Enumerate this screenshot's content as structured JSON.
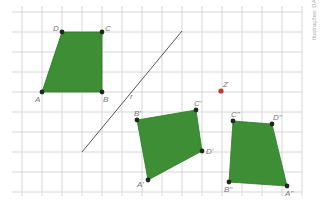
{
  "figure": {
    "credit": "Ilustrações: DAE",
    "grid": {
      "x0": 12,
      "x1": 302,
      "y0": 12,
      "y1": 192,
      "step": 20,
      "color": "#d6d6d6"
    },
    "fill_color": "#3e8e35",
    "point_color": "#1f2a1f",
    "center_color": "#c0392b",
    "line_r": {
      "label": "r",
      "x1": 182,
      "y1": 31,
      "x2": 82,
      "y2": 152
    },
    "center_z": {
      "label": "Z",
      "x": 221,
      "y": 91
    },
    "polygons": [
      {
        "name": "ABCD",
        "points": [
          {
            "label": "A",
            "x": 42,
            "y": 92,
            "lx": 35,
            "ly": 102
          },
          {
            "label": "B",
            "x": 102,
            "y": 92,
            "lx": 103,
            "ly": 102
          },
          {
            "label": "C",
            "x": 102,
            "y": 32,
            "lx": 105,
            "ly": 31
          },
          {
            "label": "D",
            "x": 62,
            "y": 32,
            "lx": 53,
            "ly": 31
          }
        ]
      },
      {
        "name": "A'B'C'D'",
        "points": [
          {
            "label": "A'",
            "x": 148,
            "y": 180,
            "lx": 137,
            "ly": 187
          },
          {
            "label": "B'",
            "x": 137,
            "y": 120,
            "lx": 134,
            "ly": 116
          },
          {
            "label": "C'",
            "x": 196,
            "y": 110,
            "lx": 194,
            "ly": 106
          },
          {
            "label": "D'",
            "x": 202,
            "y": 151,
            "lx": 206,
            "ly": 154
          }
        ]
      },
      {
        "name": "A''B''C''D''",
        "points": [
          {
            "label": "A''",
            "x": 287,
            "y": 186,
            "lx": 285,
            "ly": 196
          },
          {
            "label": "B''",
            "x": 229,
            "y": 182,
            "lx": 224,
            "ly": 192
          },
          {
            "label": "C''",
            "x": 233,
            "y": 121,
            "lx": 231,
            "ly": 117
          },
          {
            "label": "D''",
            "x": 272,
            "y": 124,
            "lx": 273,
            "ly": 120
          }
        ]
      }
    ]
  }
}
